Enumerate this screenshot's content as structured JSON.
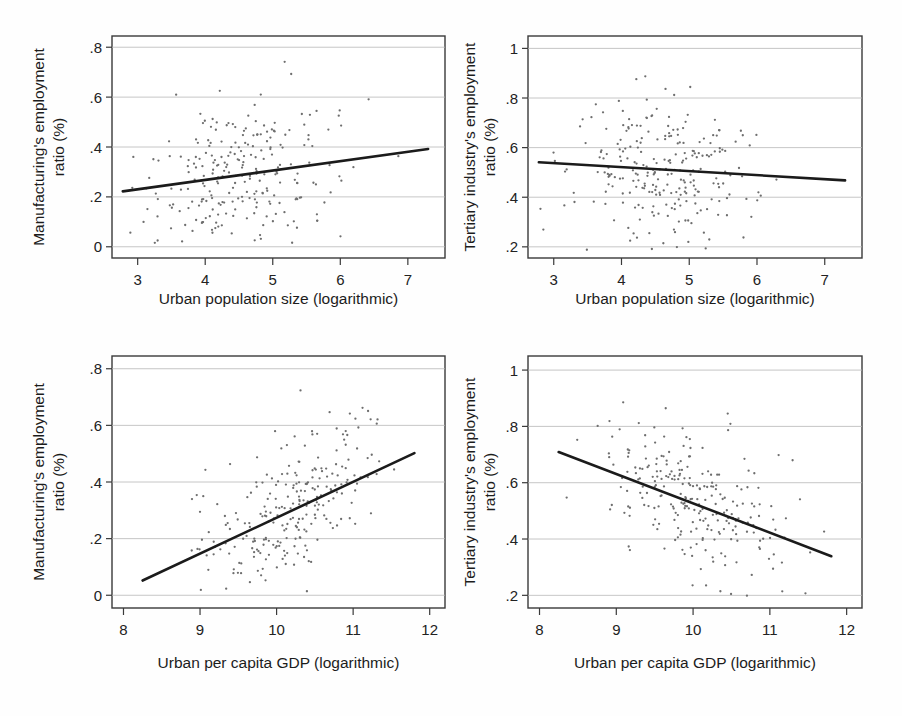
{
  "figure": {
    "background_color": "#fefefe",
    "point_color": "#6e6e6e",
    "line_color": "#1b1b1b",
    "grid_color": "#b8b8b8",
    "frame_color": "#3a3a3a"
  },
  "chart_data": [
    {
      "id": "panel-top-left",
      "type": "scatter",
      "title": "",
      "xlabel": "Urban population size (logarithmic)",
      "ylabel": "Manufacturing's employment ratio (%)",
      "ylabel_lines": [
        "Manufacturing's employment",
        "ratio (%)"
      ],
      "xlim": [
        2.62,
        7.55
      ],
      "ylim": [
        -0.045,
        0.845
      ],
      "xticks": [
        3,
        4,
        5,
        6,
        7
      ],
      "xticklabels": [
        "3",
        "4",
        "5",
        "6",
        "7"
      ],
      "yticks": [
        0,
        0.2,
        0.4,
        0.6,
        0.8
      ],
      "yticklabels": [
        "0",
        ".2",
        ".4",
        ".6",
        ".8"
      ],
      "grid": "horizontal",
      "legend": "none",
      "n_points": 255,
      "point_cloud": {
        "x_mean": 4.62,
        "x_sd": 0.72,
        "x_min": 2.78,
        "x_max": 7.3,
        "y_mean": 0.282,
        "y_sd": 0.152,
        "y_min": 0.01,
        "y_max": 0.79,
        "correlation": 0.2
      },
      "fit_line": {
        "x0": 2.78,
        "y0": 0.222,
        "x1": 7.3,
        "y1": 0.392,
        "slope": 0.0376,
        "intercept": 0.1175,
        "direction": "positive"
      }
    },
    {
      "id": "panel-top-right",
      "type": "scatter",
      "title": "",
      "xlabel": "Urban population size (logarithmic)",
      "ylabel": "Tertiary industry's employment ratio (%)",
      "ylabel_lines": [
        "Tertiary industry's employment",
        "ratio (%)"
      ],
      "xlim": [
        2.62,
        7.55
      ],
      "ylim": [
        0.155,
        1.05
      ],
      "xticks": [
        3,
        4,
        5,
        6,
        7
      ],
      "xticklabels": [
        "3",
        "4",
        "5",
        "6",
        "7"
      ],
      "yticks": [
        0.2,
        0.4,
        0.6,
        0.8,
        1.0
      ],
      "yticklabels": [
        ".2",
        ".4",
        ".6",
        ".8",
        "1"
      ],
      "grid": "horizontal",
      "legend": "none",
      "n_points": 255,
      "point_cloud": {
        "x_mean": 4.62,
        "x_sd": 0.72,
        "x_min": 2.78,
        "x_max": 7.3,
        "y_mean": 0.515,
        "y_sd": 0.142,
        "y_min": 0.185,
        "y_max": 0.89,
        "correlation": -0.09
      },
      "fit_line": {
        "x0": 2.78,
        "y0": 0.541,
        "x1": 7.3,
        "y1": 0.468,
        "slope": -0.0161,
        "intercept": 0.5858,
        "direction": "negative"
      }
    },
    {
      "id": "panel-bottom-left",
      "type": "scatter",
      "title": "",
      "xlabel": "Urban per capita GDP (logarithmic)",
      "ylabel": "Manufacturing's employment ratio (%)",
      "ylabel_lines": [
        "Manufacturing's employment",
        "ratio (%)"
      ],
      "xlim": [
        7.85,
        12.2
      ],
      "ylim": [
        -0.045,
        0.845
      ],
      "xticks": [
        8,
        9,
        10,
        11,
        12
      ],
      "xticklabels": [
        "8",
        "9",
        "10",
        "11",
        "12"
      ],
      "yticks": [
        0,
        0.2,
        0.4,
        0.6,
        0.8
      ],
      "yticklabels": [
        "0",
        ".2",
        ".4",
        ".6",
        ".8"
      ],
      "grid": "horizontal",
      "legend": "none",
      "n_points": 255,
      "point_cloud": {
        "x_mean": 10.08,
        "x_sd": 0.62,
        "x_min": 8.25,
        "x_max": 11.8,
        "y_mean": 0.282,
        "y_sd": 0.152,
        "y_min": 0.01,
        "y_max": 0.78,
        "correlation": 0.55
      },
      "fit_line": {
        "x0": 8.25,
        "y0": 0.052,
        "x1": 11.8,
        "y1": 0.502,
        "slope": 0.1268,
        "intercept": -0.9937,
        "direction": "positive"
      }
    },
    {
      "id": "panel-bottom-right",
      "type": "scatter",
      "title": "",
      "xlabel": "Urban per capita GDP (logarithmic)",
      "ylabel": "Tertiary industry's employment ratio (%)",
      "ylabel_lines": [
        "Tertiary industry's employment",
        "ratio (%)"
      ],
      "xlim": [
        7.85,
        12.2
      ],
      "ylim": [
        0.155,
        1.05
      ],
      "xticks": [
        8,
        9,
        10,
        11,
        12
      ],
      "xticklabels": [
        "8",
        "9",
        "10",
        "11",
        "12"
      ],
      "yticks": [
        0.2,
        0.4,
        0.6,
        0.8,
        1.0
      ],
      "yticklabels": [
        ".2",
        ".4",
        ".6",
        ".8",
        "1"
      ],
      "grid": "horizontal",
      "legend": "none",
      "n_points": 255,
      "point_cloud": {
        "x_mean": 10.08,
        "x_sd": 0.62,
        "x_min": 8.25,
        "x_max": 11.8,
        "y_mean": 0.525,
        "y_sd": 0.138,
        "y_min": 0.185,
        "y_max": 0.89,
        "correlation": -0.52
      },
      "fit_line": {
        "x0": 8.25,
        "y0": 0.709,
        "x1": 11.8,
        "y1": 0.339,
        "slope": -0.1042,
        "intercept": 1.569,
        "direction": "negative"
      }
    }
  ]
}
